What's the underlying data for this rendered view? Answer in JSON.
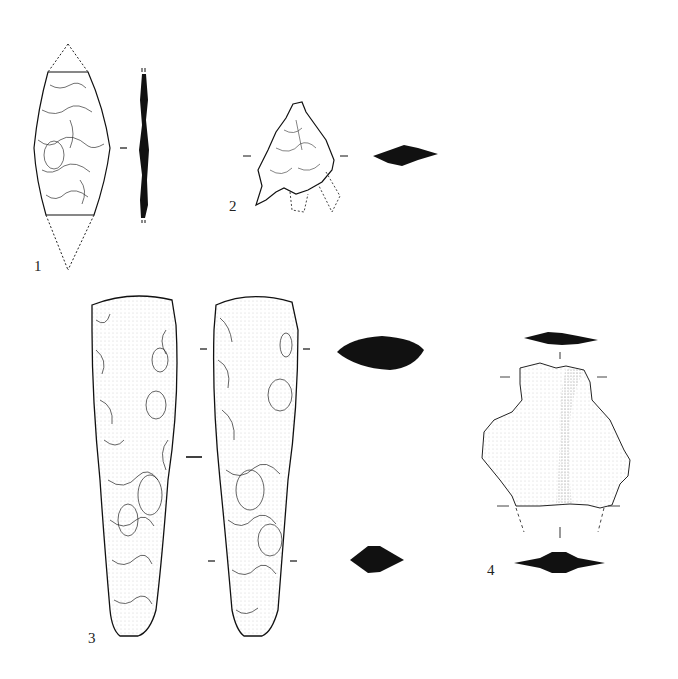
{
  "plate": {
    "background": "#ffffff",
    "ink": "#111111",
    "figures": [
      {
        "number": "1",
        "label": "1",
        "description": "bifacial leaf-shaped point, fragment with dotted reconstruction, with side section profile"
      },
      {
        "number": "2",
        "label": "2",
        "description": "tanged point fragment with dashed reconstruction and cross-section"
      },
      {
        "number": "3",
        "label": "3",
        "description": "bifacial flint axe/chisel, two faces with two cross-sections"
      },
      {
        "number": "4",
        "label": "4",
        "description": "flake fragment with dashed reconstruction and two cross-sections"
      }
    ]
  }
}
